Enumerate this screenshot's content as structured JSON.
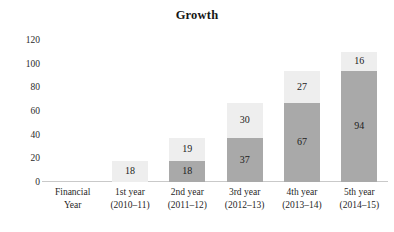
{
  "chart_data": {
    "type": "bar",
    "subtype": "stacked-column",
    "title": "Growth",
    "xlabel": "",
    "ylabel": "",
    "ylim": [
      0,
      120
    ],
    "yticks": [
      0,
      20,
      40,
      60,
      80,
      100,
      120
    ],
    "ytick_labels": [
      "0",
      "20",
      "40",
      "60",
      "80",
      "100",
      "120"
    ],
    "grid": false,
    "legend": "none",
    "categories": [
      "Financial Year",
      "1st year (2010–11)",
      "2nd year (2011–12)",
      "3rd year (2012–13)",
      "4th year (2013–14)",
      "5th year (2014–15)"
    ],
    "category_lines": [
      [
        "Financial",
        "Year"
      ],
      [
        "1st year",
        "(2010–11)"
      ],
      [
        "2nd year",
        "(2011–12)"
      ],
      [
        "3rd year",
        "(2012–13)"
      ],
      [
        "4th year",
        "(2013–14)"
      ],
      [
        "5th year",
        "(2014–15)"
      ]
    ],
    "series": [
      {
        "name": "lower-segment",
        "color": "#a9a9a9",
        "values": [
          null,
          null,
          18,
          37,
          67,
          94
        ]
      },
      {
        "name": "upper-segment",
        "color": "#eeeeee",
        "values": [
          null,
          18,
          19,
          30,
          27,
          16
        ]
      }
    ],
    "totals": [
      null,
      18,
      37,
      67,
      94,
      110
    ],
    "bars": [
      {
        "category": "Financial Year",
        "segments": []
      },
      {
        "category": "1st year (2010–11)",
        "segments": [
          {
            "tone": "light",
            "value": 18
          }
        ]
      },
      {
        "category": "2nd year (2011–12)",
        "segments": [
          {
            "tone": "dark",
            "value": 18
          },
          {
            "tone": "light",
            "value": 19
          }
        ]
      },
      {
        "category": "3rd year (2012–13)",
        "segments": [
          {
            "tone": "dark",
            "value": 37
          },
          {
            "tone": "light",
            "value": 30
          }
        ]
      },
      {
        "category": "4th year (2013–14)",
        "segments": [
          {
            "tone": "dark",
            "value": 67
          },
          {
            "tone": "light",
            "value": 27
          }
        ]
      },
      {
        "category": "5th year (2014–15)",
        "segments": [
          {
            "tone": "dark",
            "value": 94
          },
          {
            "tone": "light",
            "value": 16
          }
        ]
      }
    ],
    "colors": {
      "lower_segment": "#a9a9a9",
      "upper_segment": "#eeeeee",
      "axis_line": "#c9c9c9",
      "text": "#1a1a1a",
      "background": "#ffffff"
    }
  }
}
